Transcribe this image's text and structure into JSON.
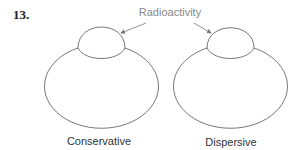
{
  "figure": {
    "number": "13.",
    "callout_label": "Radioactivity",
    "panels": [
      {
        "id": "conservative",
        "label": "Conservative"
      },
      {
        "id": "dispersive",
        "label": "Dispersive"
      }
    ]
  },
  "colors": {
    "stroke": "#555555",
    "arrow": "#777777",
    "callout_text": "#888888",
    "label_text": "#333333"
  }
}
